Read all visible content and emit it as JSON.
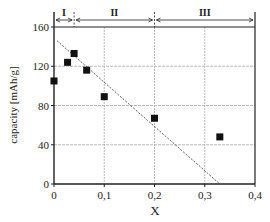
{
  "chart_data": {
    "type": "scatter",
    "title": "",
    "xlabel": "X",
    "ylabel": "capacity [mAh/g]",
    "xlim": [
      0,
      0.4
    ],
    "ylim": [
      0,
      160
    ],
    "x_ticks": [
      0,
      0.1,
      0.2,
      0.3,
      0.4
    ],
    "x_tick_labels": [
      "0",
      "0,1",
      "0,2",
      "0,3",
      "0,4"
    ],
    "y_ticks": [
      0,
      40,
      80,
      120,
      160
    ],
    "y_tick_labels": [
      "0",
      "40",
      "80",
      "120",
      "160"
    ],
    "grid": true,
    "series": [
      {
        "name": "measured capacity",
        "marker": "square",
        "x": [
          0,
          0.027,
          0.04,
          0.065,
          0.1,
          0.2,
          0.33
        ],
        "y": [
          105,
          124,
          133,
          116,
          89,
          67,
          48
        ]
      }
    ],
    "trend_line": {
      "style": "dashed",
      "x": [
        0.006,
        0.33
      ],
      "y": [
        146,
        0
      ]
    },
    "regions": [
      {
        "label": "I",
        "x_start": 0,
        "x_end": 0.04
      },
      {
        "label": "II",
        "x_start": 0.04,
        "x_end": 0.2
      },
      {
        "label": "III",
        "x_start": 0.2,
        "x_end": 0.4
      }
    ],
    "legend": null
  },
  "colors": {
    "axis": "#222222",
    "grid": "#aaaaaa",
    "marker": "#111111",
    "trend": "#333333"
  }
}
